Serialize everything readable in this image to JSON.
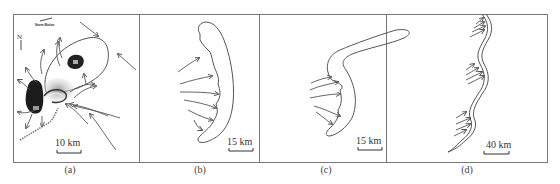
{
  "figure": {
    "panels": [
      {
        "id": "a",
        "caption": "(a)",
        "scale_label": "10 km",
        "legend_label": "Storm Motion",
        "north_label": "N",
        "cell_labels": [
          "B1",
          "B2"
        ]
      },
      {
        "id": "b",
        "caption": "(b)",
        "scale_label": "15 km"
      },
      {
        "id": "c",
        "caption": "(c)",
        "scale_label": "15 km"
      },
      {
        "id": "d",
        "caption": "(d)",
        "scale_label": "40 km"
      }
    ]
  }
}
